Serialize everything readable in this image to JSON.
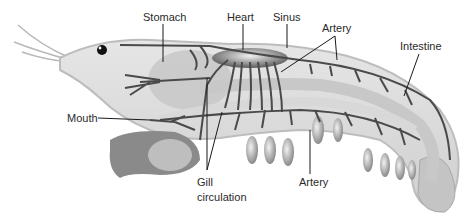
{
  "diagram": {
    "colors": {
      "body": "#d9d9d9",
      "body_outline": "#bdbdbd",
      "vessel": "#4a4a4a",
      "organ": "#bfbfbf",
      "leader": "#1a1a1a",
      "label_text": "#2a2a2a"
    },
    "labels": {
      "stomach": "Stomach",
      "heart": "Heart",
      "sinus": "Sinus",
      "artery_top": "Artery",
      "intestine": "Intestine",
      "mouth": "Mouth",
      "gill_line1": "Gill",
      "gill_line2": "circulation",
      "artery_bottom": "Artery"
    }
  }
}
